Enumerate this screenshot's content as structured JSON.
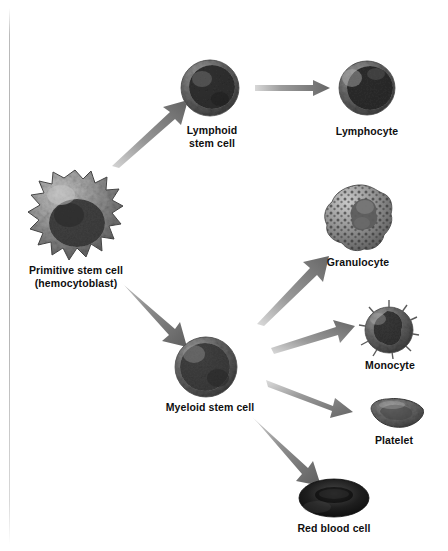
{
  "diagram": {
    "background_color": "#ffffff",
    "arrow_color": "#6e6e6e",
    "text_color": "#0f0f0f",
    "nodes": [
      {
        "id": "primitive-stem-cell",
        "label": "Primitive stem cell\n(hemocytoblast)",
        "icon": "primitive-stem-cell-image",
        "x": 75,
        "y": 215,
        "label_x": 75,
        "label_y": 277
      },
      {
        "id": "lymphoid-stem-cell",
        "label": "Lymphoid\nstem cell",
        "icon": "lymphoid-stem-cell-image",
        "x": 210,
        "y": 90,
        "label_x": 212,
        "label_y": 131
      },
      {
        "id": "lymphocyte",
        "label": "Lymphocyte",
        "icon": "lymphocyte-image",
        "x": 367,
        "y": 90,
        "label_x": 367,
        "label_y": 132
      },
      {
        "id": "myeloid-stem-cell",
        "label": "Myeloid stem cell",
        "icon": "myeloid-stem-cell-image",
        "x": 205,
        "y": 367,
        "label_x": 210,
        "label_y": 408
      },
      {
        "id": "granulocyte",
        "label": "Granulocyte",
        "icon": "granulocyte-image",
        "x": 358,
        "y": 217,
        "label_x": 358,
        "label_y": 262
      },
      {
        "id": "monocyte",
        "label": "Monocyte",
        "icon": "monocyte-image",
        "x": 389,
        "y": 328,
        "label_x": 390,
        "label_y": 365
      },
      {
        "id": "platelet",
        "label": "Platelet",
        "icon": "platelet-image",
        "x": 394,
        "y": 412,
        "label_x": 394,
        "label_y": 440
      },
      {
        "id": "red-blood-cell",
        "label": "Red blood cell",
        "icon": "red-blood-cell-image",
        "x": 334,
        "y": 497,
        "label_x": 334,
        "label_y": 528
      }
    ],
    "arrows": [
      {
        "id": "arrow-primitive-to-lymphoid",
        "from": "primitive-stem-cell",
        "to": "lymphoid-stem-cell"
      },
      {
        "id": "arrow-lymphoid-to-lymphocyte",
        "from": "lymphoid-stem-cell",
        "to": "lymphocyte"
      },
      {
        "id": "arrow-primitive-to-myeloid",
        "from": "primitive-stem-cell",
        "to": "myeloid-stem-cell"
      },
      {
        "id": "arrow-myeloid-to-granulocyte",
        "from": "myeloid-stem-cell",
        "to": "granulocyte"
      },
      {
        "id": "arrow-myeloid-to-monocyte",
        "from": "myeloid-stem-cell",
        "to": "monocyte"
      },
      {
        "id": "arrow-myeloid-to-platelet",
        "from": "myeloid-stem-cell",
        "to": "platelet"
      },
      {
        "id": "arrow-myeloid-to-rbc",
        "from": "myeloid-stem-cell",
        "to": "red-blood-cell"
      }
    ]
  }
}
